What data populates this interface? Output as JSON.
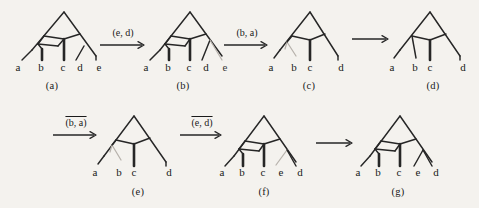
{
  "figure": {
    "background_color": "#f4f2ee",
    "ink_color": "#262626",
    "faded_color": "#b7b2ac"
  },
  "panels": [
    {
      "id": "a",
      "caption": "(a)",
      "leaves": [
        "a",
        "b",
        "c",
        "d",
        "e"
      ],
      "leaf_count": 5
    },
    {
      "id": "b",
      "caption": "(b)",
      "leaves": [
        "a",
        "b",
        "c",
        "d",
        "e"
      ],
      "leaf_count": 5
    },
    {
      "id": "c",
      "caption": "(c)",
      "leaves": [
        "a",
        "b",
        "c",
        "d"
      ],
      "leaf_count": 4
    },
    {
      "id": "d",
      "caption": "(d)",
      "leaves": [
        "a",
        "b",
        "c",
        "d"
      ],
      "leaf_count": 4
    },
    {
      "id": "e",
      "caption": "(e)",
      "leaves": [
        "a",
        "b",
        "c",
        "d"
      ],
      "leaf_count": 4
    },
    {
      "id": "f",
      "caption": "(f)",
      "leaves": [
        "a",
        "b",
        "c",
        "e",
        "d"
      ],
      "leaf_count": 5
    },
    {
      "id": "g",
      "caption": "(g)",
      "leaves": [
        "a",
        "b",
        "c",
        "e",
        "d"
      ],
      "leaf_count": 5
    }
  ],
  "arrows": [
    {
      "id": "arrow-1",
      "label": "(e, d)",
      "barred": false,
      "glyph": "⟶"
    },
    {
      "id": "arrow-2",
      "label": "(b, a)",
      "barred": false,
      "glyph": "⟶"
    },
    {
      "id": "arrow-3",
      "label": "",
      "barred": false,
      "glyph": "⟶"
    },
    {
      "id": "arrow-4",
      "label": "(b, a)",
      "barred": true,
      "glyph": "⟶"
    },
    {
      "id": "arrow-5",
      "label": "(e, d)",
      "barred": true,
      "glyph": "⟶"
    },
    {
      "id": "arrow-6",
      "label": "",
      "barred": false,
      "glyph": "⟶"
    }
  ]
}
